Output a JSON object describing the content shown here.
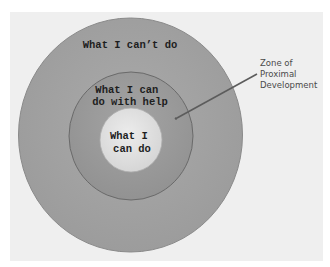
{
  "diagram": {
    "type": "concentric-circles",
    "title": "Zone of Proximal Development",
    "circles": [
      {
        "id": "outer",
        "lines": [
          "What I can’t do"
        ],
        "fill": "#a2a2a2"
      },
      {
        "id": "middle",
        "lines": [
          "What I can",
          "do with help"
        ],
        "fill": "#999999"
      },
      {
        "id": "inner",
        "lines": [
          "What I",
          "can do"
        ],
        "fill": "#e2e2e2"
      }
    ],
    "annotation": {
      "lines": [
        "Zone of",
        "Proximal",
        "Development"
      ],
      "points_to": "middle"
    },
    "colors": {
      "background": "#efefef",
      "stroke": "#6a6a6a",
      "arrow": "#5c5c5c"
    }
  }
}
